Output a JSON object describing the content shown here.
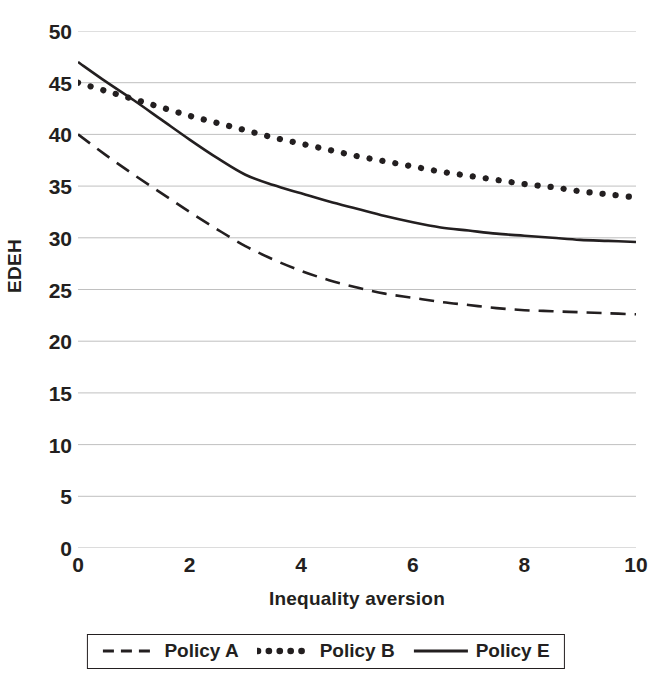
{
  "chart_data": {
    "type": "line",
    "title": "",
    "xlabel": "Inequality aversion",
    "ylabel": "EDEH",
    "xlim": [
      0,
      10
    ],
    "ylim": [
      0,
      50
    ],
    "xticks": [
      0,
      2,
      4,
      6,
      8,
      10
    ],
    "yticks": [
      0,
      5,
      10,
      15,
      20,
      25,
      30,
      35,
      40,
      45,
      50
    ],
    "grid": "horizontal",
    "legend_position": "bottom",
    "x": [
      0,
      0.5,
      1,
      1.5,
      2,
      2.5,
      3,
      3.5,
      4,
      4.5,
      5,
      5.5,
      6,
      6.5,
      7,
      7.5,
      8,
      8.5,
      9,
      9.5,
      10
    ],
    "series": [
      {
        "name": "Policy A",
        "style": "dashed",
        "color": "#231f20",
        "values": [
          40.0,
          38.0,
          36.1,
          34.3,
          32.5,
          30.8,
          29.2,
          27.9,
          26.8,
          25.9,
          25.2,
          24.6,
          24.2,
          23.8,
          23.5,
          23.2,
          23.0,
          22.9,
          22.8,
          22.7,
          22.6
        ]
      },
      {
        "name": "Policy B",
        "style": "dotted",
        "color": "#231f20",
        "values": [
          45.0,
          44.2,
          43.4,
          42.6,
          41.8,
          41.1,
          40.4,
          39.7,
          39.1,
          38.5,
          37.9,
          37.4,
          36.9,
          36.4,
          36.0,
          35.6,
          35.2,
          34.9,
          34.5,
          34.2,
          33.9
        ]
      },
      {
        "name": "Policy E",
        "style": "solid",
        "color": "#231f20",
        "values": [
          47.0,
          45.1,
          43.3,
          41.4,
          39.5,
          37.7,
          36.1,
          35.1,
          34.3,
          33.5,
          32.8,
          32.1,
          31.5,
          31.0,
          30.7,
          30.4,
          30.2,
          30.0,
          29.8,
          29.7,
          29.6
        ]
      }
    ]
  },
  "axes": {
    "y_label": "EDEH",
    "x_label": "Inequality aversion",
    "y_ticks": [
      "0",
      "5",
      "10",
      "15",
      "20",
      "25",
      "30",
      "35",
      "40",
      "45",
      "50"
    ],
    "x_ticks": [
      "0",
      "2",
      "4",
      "6",
      "8",
      "10"
    ]
  },
  "legend": {
    "entries": [
      {
        "label": "Policy A",
        "style": "dashed"
      },
      {
        "label": "Policy B",
        "style": "dotted"
      },
      {
        "label": "Policy E",
        "style": "solid"
      }
    ]
  },
  "colors": {
    "ink": "#231f20",
    "gridline": "#b9b9b9",
    "background": "#ffffff"
  }
}
